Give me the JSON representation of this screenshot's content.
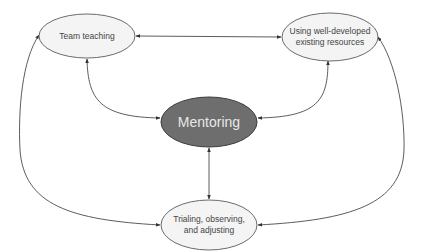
{
  "diagram": {
    "type": "concept-map",
    "colors": {
      "node_fill": "#f4f4f4",
      "node_stroke": "#5a5a5a",
      "center_fill": "#6e6e6e",
      "center_stroke": "#3c3c3c",
      "center_text": "#e8e8e8",
      "edge": "#4a4a4a",
      "text": "#444444"
    },
    "nodes": {
      "team_teaching": {
        "label": "Team teaching"
      },
      "existing_resources": {
        "label_line1": "Using well-developed",
        "label_line2": "existing resources"
      },
      "mentoring": {
        "label": "Mentoring"
      },
      "trialing": {
        "label_line1": "Trialing, observing,",
        "label_line2": "and adjusting"
      }
    },
    "edges": [
      {
        "from": "team_teaching",
        "to": "existing_resources",
        "bidirectional": true
      },
      {
        "from": "team_teaching",
        "to": "mentoring",
        "bidirectional": true
      },
      {
        "from": "existing_resources",
        "to": "mentoring",
        "bidirectional": true
      },
      {
        "from": "mentoring",
        "to": "trialing",
        "bidirectional": true
      },
      {
        "from": "team_teaching",
        "to": "trialing",
        "bidirectional": true
      },
      {
        "from": "existing_resources",
        "to": "trialing",
        "bidirectional": true
      }
    ]
  }
}
